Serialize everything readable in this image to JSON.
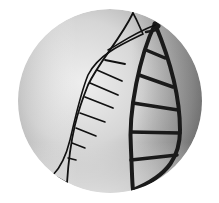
{
  "image": {
    "description": "Circular black-and-white photograph of a wire DNA double-helix model casting a dark helix-shaped shadow",
    "subject": "DNA double helix model",
    "style": "grayscale",
    "crop": "circle"
  },
  "colors": {
    "background": "#ffffff",
    "light_tone": "#eeeeee",
    "mid_tone": "#b5b5b5",
    "dark_tone": "#6e6e6e",
    "wire": "#111111",
    "shadow": "#1a1a1a"
  }
}
